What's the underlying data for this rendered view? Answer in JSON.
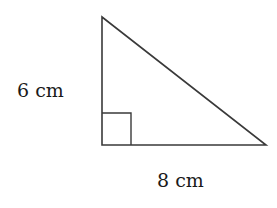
{
  "diagram": {
    "type": "right-triangle",
    "labels": {
      "height": "6 cm",
      "base": "8 cm"
    },
    "vertices": {
      "top": [
        102,
        17
      ],
      "right_angle": [
        102,
        145
      ],
      "right": [
        266,
        145
      ]
    },
    "right_angle_marker_size": 29,
    "stroke_color": "#3a3a3a"
  }
}
